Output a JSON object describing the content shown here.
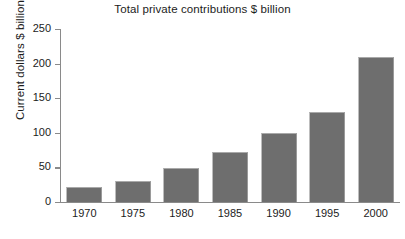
{
  "chart_data": {
    "type": "bar",
    "title": "Total private contributions $ billion",
    "xlabel": "",
    "ylabel": "Current dollars $ billion",
    "categories": [
      "1970",
      "1975",
      "1980",
      "1985",
      "1990",
      "1995",
      "2000"
    ],
    "values": [
      22,
      30,
      49,
      72,
      100,
      130,
      210
    ],
    "ylim": [
      0,
      250
    ],
    "yticks": [
      0,
      50,
      100,
      150,
      200,
      250
    ],
    "ytick_labels": [
      "0",
      "50",
      "100",
      "150",
      "200",
      "250"
    ],
    "grid": false,
    "legend": null,
    "series": [
      {
        "name": "Total private contributions",
        "values": [
          22,
          30,
          49,
          72,
          100,
          130,
          210
        ]
      }
    ],
    "colors": {
      "bar_fill": "#6e6e6e",
      "axis": "#8a8a8a",
      "text": "#1c1c1c",
      "background": "#ffffff"
    }
  }
}
